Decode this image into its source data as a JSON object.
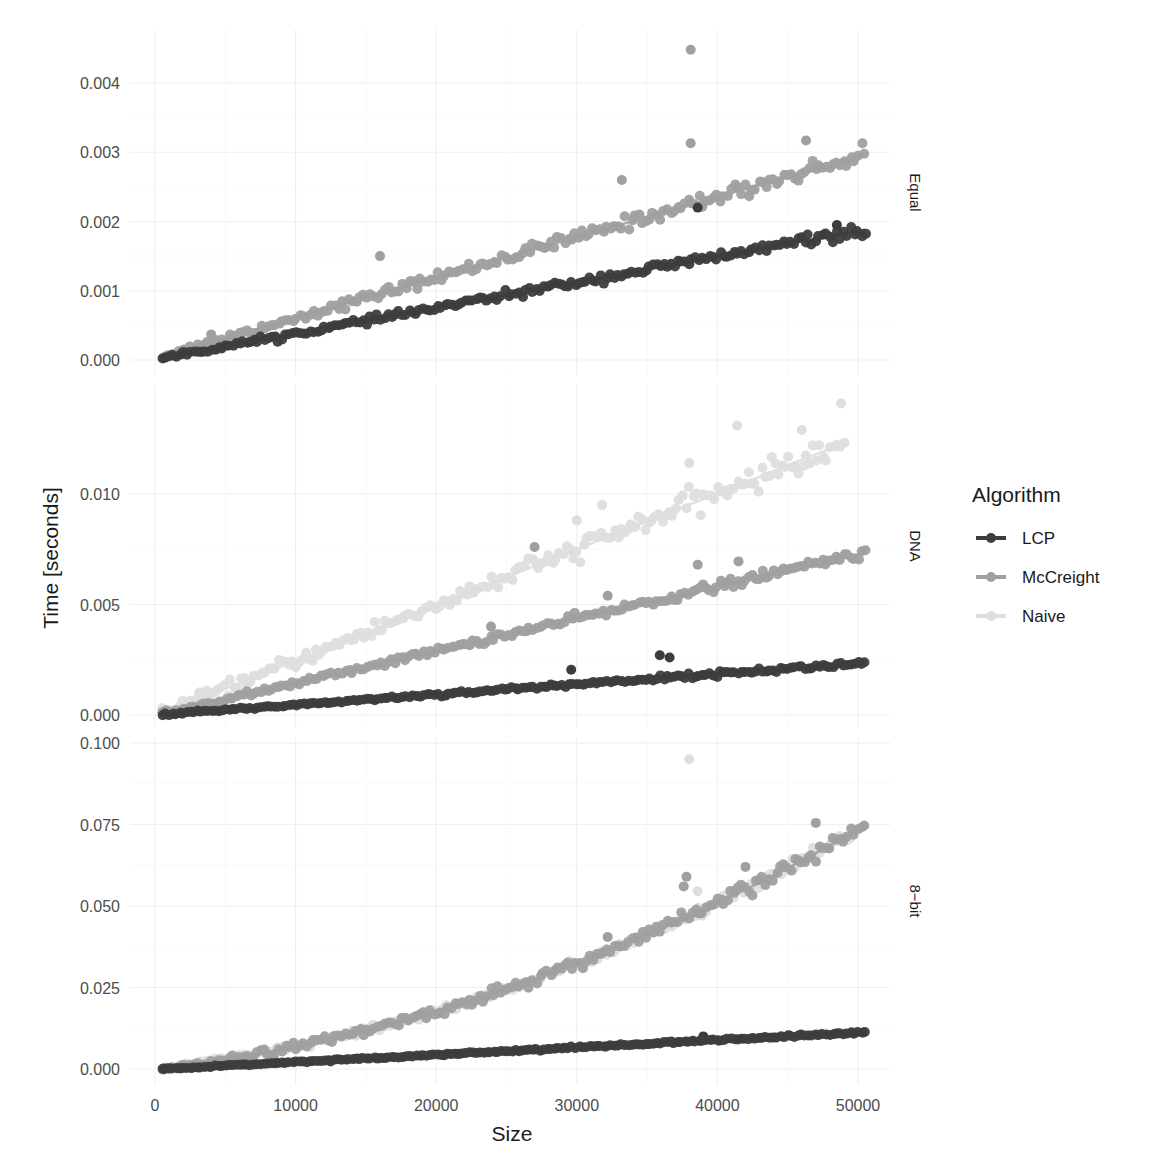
{
  "chart_data": {
    "type": "scatter",
    "title": "",
    "xlabel": "Size",
    "ylabel": "Time [seconds]",
    "facet_by": "Alphabet",
    "x_ticks": [
      0,
      10000,
      20000,
      30000,
      40000,
      50000
    ],
    "x_tick_labels": [
      "0",
      "10000",
      "20000",
      "30000",
      "40000",
      "50000"
    ],
    "xlim": [
      0,
      50500
    ],
    "grid": true,
    "legend": {
      "title": "Algorithm",
      "position": "right",
      "entries": [
        {
          "label": "LCP",
          "color": "#3d3d3d"
        },
        {
          "label": "McCreight",
          "color": "#a0a0a0"
        },
        {
          "label": "Naive",
          "color": "#dedede"
        }
      ]
    },
    "panels": [
      {
        "strip": "Equal",
        "y_ticks": [
          0.0,
          0.001,
          0.002,
          0.003,
          0.004
        ],
        "y_tick_labels": [
          "0.000",
          "0.001",
          "0.002",
          "0.003",
          "0.004"
        ],
        "ylim": [
          -0.0002,
          0.0046
        ],
        "series": [
          {
            "name": "LCP",
            "model": "linear",
            "x_range": [
              500,
              50500
            ],
            "y_at_start": 3e-05,
            "y_at_end": 0.00188,
            "noise": 4e-05,
            "outliers": [
              [
                38600,
                0.0022
              ],
              [
                48500,
                0.00195
              ]
            ]
          },
          {
            "name": "McCreight",
            "model": "linear",
            "x_range": [
              500,
              50500
            ],
            "y_at_start": 5e-05,
            "y_at_end": 0.00297,
            "noise": 6e-05,
            "outliers": [
              [
                16000,
                0.0015
              ],
              [
                4000,
                0.00037
              ],
              [
                38100,
                0.00313
              ],
              [
                38100,
                0.00448
              ],
              [
                46300,
                0.00317
              ],
              [
                33200,
                0.0026
              ]
            ]
          }
        ]
      },
      {
        "strip": "DNA",
        "y_ticks": [
          0.0,
          0.005,
          0.01
        ],
        "y_tick_labels": [
          "0.000",
          "0.005",
          "0.010"
        ],
        "ylim": [
          -0.0003,
          0.015
        ],
        "series": [
          {
            "name": "LCP",
            "model": "linear",
            "x_range": [
              500,
              50500
            ],
            "y_at_start": 2e-05,
            "y_at_end": 0.00235,
            "noise": 6e-05,
            "outliers": [
              [
                29600,
                0.00205
              ],
              [
                35900,
                0.0027
              ],
              [
                36600,
                0.0026
              ]
            ]
          },
          {
            "name": "McCreight",
            "model": "linear",
            "x_range": [
              500,
              50500
            ],
            "y_at_start": 5e-05,
            "y_at_end": 0.00735,
            "noise": 0.00012,
            "outliers": [
              [
                23900,
                0.004
              ],
              [
                27000,
                0.0076
              ],
              [
                32200,
                0.0054
              ],
              [
                38600,
                0.0068
              ],
              [
                41500,
                0.00695
              ]
            ]
          },
          {
            "name": "Naive",
            "model": "linear",
            "x_range": [
              500,
              49000
            ],
            "y_at_start": 5e-05,
            "y_at_end": 0.0123,
            "noise": 0.0003,
            "outliers": [
              [
                31800,
                0.0095
              ],
              [
                38000,
                0.0114
              ],
              [
                41400,
                0.0131
              ],
              [
                46000,
                0.0129
              ],
              [
                48800,
                0.0141
              ],
              [
                30000,
                0.0088
              ]
            ]
          }
        ]
      },
      {
        "strip": "8-bit",
        "y_ticks": [
          0.0,
          0.025,
          0.05,
          0.075,
          0.1
        ],
        "y_tick_labels": [
          "0.000",
          "0.025",
          "0.050",
          "0.075",
          "0.100"
        ],
        "ylim": [
          -0.004,
          0.103
        ],
        "series": [
          {
            "name": "LCP",
            "model": "linear",
            "x_range": [
              500,
              50500
            ],
            "y_at_start": 0.0,
            "y_at_end": 0.0112,
            "noise": 0.0002,
            "outliers": [
              [
                39000,
                0.01
              ]
            ]
          },
          {
            "name": "McCreight",
            "model": "quadratic",
            "x_range": [
              500,
              50500
            ],
            "y_at_start": 0.0002,
            "y_at_end": 0.0745,
            "noise": 0.0012,
            "outliers": [
              [
                37800,
                0.059
              ],
              [
                37600,
                0.056
              ],
              [
                47000,
                0.0755
              ],
              [
                42000,
                0.062
              ],
              [
                32200,
                0.0405
              ]
            ]
          },
          {
            "name": "Naive",
            "model": "quadratic",
            "x_range": [
              500,
              49500
            ],
            "y_at_start": 0.0002,
            "y_at_end": 0.072,
            "noise": 0.001,
            "outliers": [
              [
                38000,
                0.095
              ],
              [
                38600,
                0.0545
              ]
            ]
          }
        ]
      }
    ]
  },
  "labels": {
    "x_axis_title": "Size",
    "y_axis_title": "Time [seconds]",
    "legend_title": "Algorithm",
    "strip_equal": "Equal",
    "strip_dna": "DNA",
    "strip_8bit": "8−bit"
  }
}
